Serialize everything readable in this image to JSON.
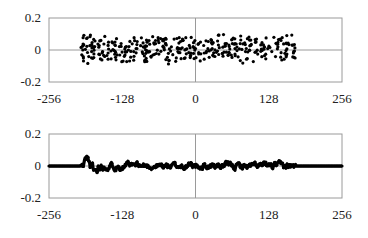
{
  "chart_data": [
    {
      "type": "scatter",
      "title": "",
      "xlabel": "",
      "ylabel": "",
      "xlim": [
        -256,
        256
      ],
      "ylim": [
        -0.2,
        0.2
      ],
      "xticks": [
        "-256",
        "-128",
        "0",
        "128",
        "256"
      ],
      "yticks": [
        "0.2",
        "0",
        "-0.2"
      ],
      "grid": false,
      "reference_lines": {
        "x": 0,
        "y": 0
      },
      "marker_color": "#000000",
      "data_range_x": [
        -200,
        175
      ],
      "description": "Noisy scattered points uniformly distributed roughly between -0.1 and 0.13 across x from about -200 to 175",
      "seed": 7,
      "n_points": 376,
      "amplitude": 0.1
    },
    {
      "type": "line",
      "title": "",
      "xlabel": "",
      "ylabel": "",
      "xlim": [
        -256,
        256
      ],
      "ylim": [
        -0.2,
        0.2
      ],
      "xticks": [
        "-256",
        "-128",
        "0",
        "128",
        "256"
      ],
      "yticks": [
        "0.2",
        "0",
        "-0.2"
      ],
      "grid": false,
      "reference_lines": {
        "x": 0,
        "y": 0
      },
      "marker_color": "#000000",
      "data_range_x": [
        -200,
        175
      ],
      "description": "Dense marker line: flat at 0 outside [-200,175]; small oscillations (about ±0.06) inside, peak near x=-190 at ~0.06",
      "seed": 11,
      "amplitude": 0.03
    }
  ]
}
